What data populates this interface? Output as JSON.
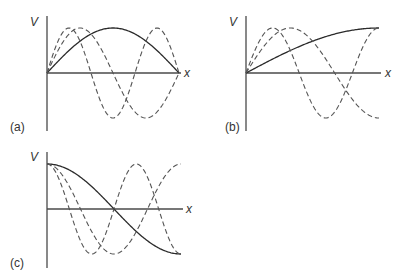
{
  "figure": {
    "panels": [
      {
        "id": "a",
        "label": "(a)",
        "y_axis_label": "V",
        "x_axis_label": "x",
        "origin": [
          47,
          73
        ],
        "length_px": 132,
        "amplitude_px": 45,
        "y_axis_range": [
          16,
          131
        ],
        "curves": [
          {
            "style": "solid",
            "func": "sin",
            "k": 1,
            "desc": "sin(πx/L)"
          },
          {
            "style": "dashed",
            "func": "sin",
            "k": 2,
            "desc": "sin(2πx/L)"
          },
          {
            "style": "dashed",
            "func": "sin",
            "k": 3,
            "desc": "sin(3πx/L)"
          }
        ]
      },
      {
        "id": "b",
        "label": "(b)",
        "y_axis_label": "V",
        "x_axis_label": "x",
        "origin": [
          246,
          73
        ],
        "length_px": 133,
        "amplitude_px": 45,
        "y_axis_range": [
          16,
          131
        ],
        "curves": [
          {
            "style": "solid",
            "func": "sin",
            "k": 0.5,
            "desc": "sin(πx/2L)"
          },
          {
            "style": "dashed",
            "func": "sin",
            "k": 1.5,
            "desc": "sin(3πx/2L)"
          },
          {
            "style": "dashed",
            "func": "sin",
            "k": 2.5,
            "desc": "sin(5πx/2L)"
          }
        ]
      },
      {
        "id": "c",
        "label": "(c)",
        "y_axis_label": "V",
        "x_axis_label": "x",
        "origin": [
          47,
          209
        ],
        "length_px": 134,
        "amplitude_px": 45,
        "y_axis_range": [
          152,
          268
        ],
        "curves": [
          {
            "style": "solid",
            "func": "cos",
            "k": 1,
            "desc": "cos(πx/L)"
          },
          {
            "style": "dashed",
            "func": "cos",
            "k": 2,
            "desc": "cos(2πx/L)"
          },
          {
            "style": "dashed",
            "func": "cos",
            "k": 3,
            "desc": "cos(3πx/L)"
          }
        ]
      }
    ]
  }
}
